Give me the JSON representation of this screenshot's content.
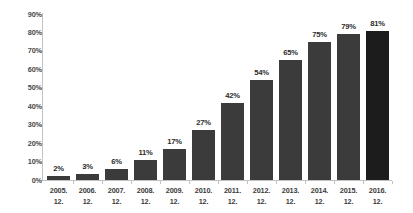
{
  "chart_data": {
    "type": "bar",
    "title": "",
    "subtitle": "",
    "xlabel": "",
    "ylabel": "",
    "categories": [
      "2005.",
      "2006.",
      "2007.",
      "2008.",
      "2009.",
      "2010.",
      "2011.",
      "2012.",
      "2013.",
      "2014.",
      "2015.",
      "2016."
    ],
    "category_sublabels": [
      "12.",
      "12.",
      "12.",
      "12.",
      "12.",
      "12.",
      "12.",
      "12.",
      "12.",
      "12.",
      "12.",
      "12."
    ],
    "values": [
      2,
      3,
      6,
      11,
      17,
      27,
      42,
      54,
      65,
      75,
      79,
      81
    ],
    "value_labels": [
      "2%",
      "3%",
      "6%",
      "11%",
      "17%",
      "27%",
      "42%",
      "54%",
      "65%",
      "75%",
      "79%",
      "81%"
    ],
    "ylim": [
      0,
      90
    ],
    "ytick_values": [
      0,
      10,
      20,
      30,
      40,
      50,
      60,
      70,
      80,
      90
    ],
    "ytick_labels": [
      "0%",
      "10%",
      "20%",
      "30%",
      "40%",
      "50%",
      "60%",
      "70%",
      "80%",
      "90%"
    ],
    "grid": false,
    "legend": false,
    "legend_position": "none",
    "bar_color": "#3b3b3b",
    "highlight_bar_color": "#1c1c1c",
    "highlight_index": 11,
    "axis_color": "#c2c2c2",
    "label_color": "#2b2b2b",
    "background_color": "#ffffff"
  }
}
